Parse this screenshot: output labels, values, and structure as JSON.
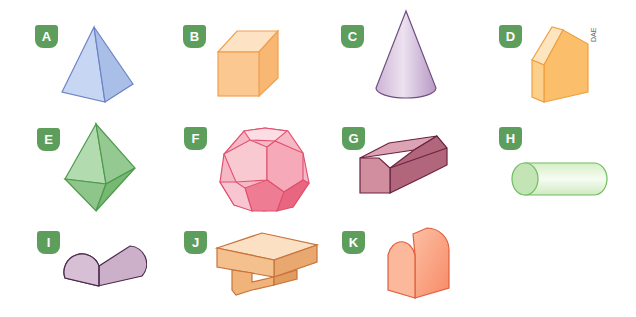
{
  "figure": {
    "credit": "DAE",
    "badge_color": "#5e9e5c",
    "items": [
      {
        "label": "A",
        "shape": "pyramid",
        "color": "#b9cdee"
      },
      {
        "label": "B",
        "shape": "cube",
        "color": "#fbc68e"
      },
      {
        "label": "C",
        "shape": "cone",
        "color": "#d9c6de"
      },
      {
        "label": "D",
        "shape": "pentagonal-prism",
        "color": "#fbc070"
      },
      {
        "label": "E",
        "shape": "octahedron",
        "color": "#8cc58a"
      },
      {
        "label": "F",
        "shape": "dodecahedron",
        "color": "#f28ea1"
      },
      {
        "label": "G",
        "shape": "hexagonal-prism",
        "color": "#b6687c"
      },
      {
        "label": "H",
        "shape": "cylinder",
        "color": "#d9f0cf"
      },
      {
        "label": "I",
        "shape": "half-cylinder",
        "color": "#c3a7c0"
      },
      {
        "label": "J",
        "shape": "t-prism",
        "color": "#f0bf8e"
      },
      {
        "label": "K",
        "shape": "arch-prism",
        "color": "#f9a484"
      }
    ]
  }
}
